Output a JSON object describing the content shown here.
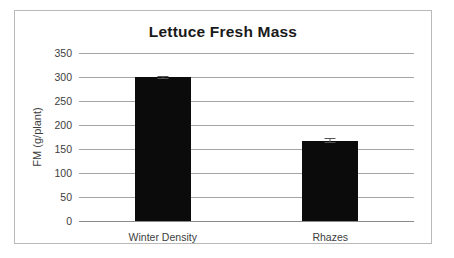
{
  "chart_data": {
    "type": "bar",
    "title": "Lettuce Fresh Mass",
    "xlabel": "",
    "ylabel": "FM (g/plant)",
    "categories": [
      "Winter Density",
      "Rhazes"
    ],
    "values": [
      299,
      167
    ],
    "errors": [
      4,
      5
    ],
    "yticks": [
      0,
      50,
      100,
      150,
      200,
      250,
      300,
      350
    ],
    "ytick_labels": [
      "0",
      "50",
      "100",
      "150",
      "200",
      "250",
      "300",
      "350"
    ],
    "ylim": [
      0,
      350
    ],
    "grid": true,
    "legend": "none",
    "bar_color": "#0b0b0b",
    "gridline_color": "#a6a6a6",
    "text_color": "#3d3d3d",
    "title_color": "#1a1a1a",
    "frame_color": "#b9b9b9"
  }
}
